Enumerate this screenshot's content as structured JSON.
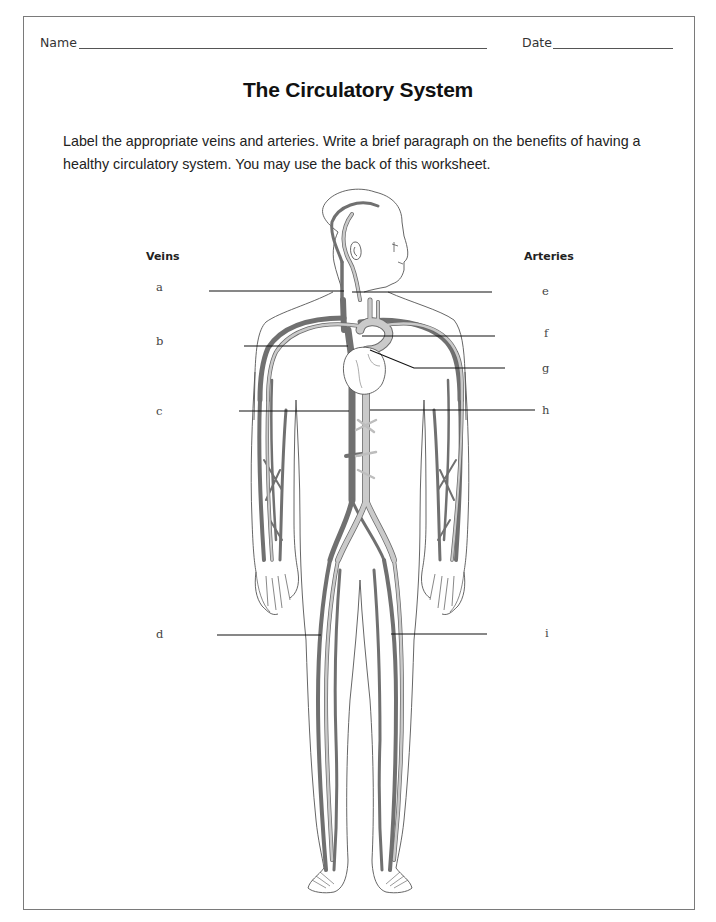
{
  "header": {
    "name_label": "Name",
    "date_label": "Date"
  },
  "title": "The Circulatory System",
  "instructions": "Label the appropriate veins and arteries. Write a brief paragraph on the benefits of having a healthy circulatory system. You may use the back of this worksheet.",
  "diagram": {
    "veins_heading": "Veins",
    "arteries_heading": "Arteries",
    "veins": [
      {
        "letter": "a"
      },
      {
        "letter": "b"
      },
      {
        "letter": "c"
      },
      {
        "letter": "d"
      }
    ],
    "arteries": [
      {
        "letter": "e"
      },
      {
        "letter": "f"
      },
      {
        "letter": "g"
      },
      {
        "letter": "h"
      },
      {
        "letter": "i"
      }
    ],
    "colors": {
      "vein": "#707070",
      "artery": "#c9c9c9",
      "outline": "#555555"
    }
  }
}
